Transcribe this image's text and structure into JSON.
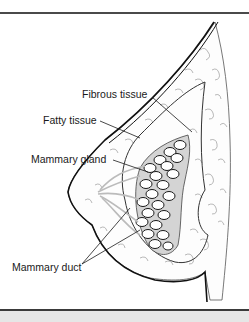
{
  "figure": {
    "labels": {
      "fibrous": "Fibrous tissue",
      "fatty": "Fatty tissue",
      "gland": "Mammary gland",
      "duct": "Mammary duct"
    },
    "colors": {
      "outline": "#1a1a1a",
      "lobule_fill": "#ffffff",
      "gland_shade": "#d0d0d0",
      "duct_shade": "#c8c8c8",
      "fat_lines": "#777777",
      "border": "#3a3a3a",
      "bottom_strip": "#e6e6e6"
    }
  }
}
